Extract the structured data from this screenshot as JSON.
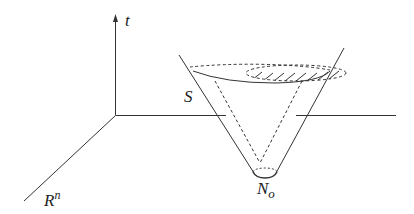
{
  "diagram": {
    "labels": {
      "time_axis": "t",
      "space_axis_base": "R",
      "space_axis_sup": "n",
      "surface": "S",
      "point_base": "N",
      "point_sub": "o"
    },
    "colors": {
      "stroke": "#333333",
      "background": "#ffffff"
    }
  }
}
